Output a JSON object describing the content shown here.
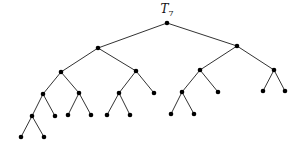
{
  "diagram": {
    "type": "binary-tree",
    "title": "T",
    "title_subscript": "7",
    "title_pos": [
      167,
      13
    ],
    "node_radius": 2.3,
    "colors": {
      "edge": "#333333",
      "node": "#000000",
      "background": "#ffffff"
    },
    "nodes": [
      {
        "id": "r",
        "x": 167,
        "y": 23
      },
      {
        "id": "L",
        "x": 98,
        "y": 48
      },
      {
        "id": "R",
        "x": 237,
        "y": 46
      },
      {
        "id": "LL",
        "x": 61,
        "y": 72
      },
      {
        "id": "LR",
        "x": 136,
        "y": 71
      },
      {
        "id": "RL",
        "x": 200,
        "y": 70
      },
      {
        "id": "RR",
        "x": 274,
        "y": 70
      },
      {
        "id": "LLL",
        "x": 43,
        "y": 94
      },
      {
        "id": "LLR",
        "x": 79,
        "y": 93
      },
      {
        "id": "LRL",
        "x": 119,
        "y": 93
      },
      {
        "id": "LRR",
        "x": 154,
        "y": 93
      },
      {
        "id": "RLL",
        "x": 182,
        "y": 92
      },
      {
        "id": "RLR",
        "x": 218,
        "y": 92
      },
      {
        "id": "RRL",
        "x": 263,
        "y": 91
      },
      {
        "id": "RRR",
        "x": 285,
        "y": 91
      },
      {
        "id": "LLLL",
        "x": 32,
        "y": 116
      },
      {
        "id": "LLLR",
        "x": 55,
        "y": 116
      },
      {
        "id": "LLRL",
        "x": 68,
        "y": 115
      },
      {
        "id": "LLRR",
        "x": 91,
        "y": 115
      },
      {
        "id": "LRLL",
        "x": 107,
        "y": 115
      },
      {
        "id": "LRLR",
        "x": 130,
        "y": 115
      },
      {
        "id": "RLLL",
        "x": 171,
        "y": 114
      },
      {
        "id": "RLLR",
        "x": 194,
        "y": 114
      },
      {
        "id": "LLLLL",
        "x": 21,
        "y": 137
      },
      {
        "id": "LLLLR",
        "x": 44,
        "y": 137
      }
    ],
    "edges": [
      [
        "r",
        "L"
      ],
      [
        "r",
        "R"
      ],
      [
        "L",
        "LL"
      ],
      [
        "L",
        "LR"
      ],
      [
        "R",
        "RL"
      ],
      [
        "R",
        "RR"
      ],
      [
        "LL",
        "LLL"
      ],
      [
        "LL",
        "LLR"
      ],
      [
        "LR",
        "LRL"
      ],
      [
        "LR",
        "LRR"
      ],
      [
        "RL",
        "RLL"
      ],
      [
        "RL",
        "RLR"
      ],
      [
        "RR",
        "RRL"
      ],
      [
        "RR",
        "RRR"
      ],
      [
        "LLL",
        "LLLL"
      ],
      [
        "LLL",
        "LLLR"
      ],
      [
        "LLR",
        "LLRL"
      ],
      [
        "LLR",
        "LLRR"
      ],
      [
        "LRL",
        "LRLL"
      ],
      [
        "LRL",
        "LRLR"
      ],
      [
        "RLL",
        "RLLL"
      ],
      [
        "RLL",
        "RLLR"
      ],
      [
        "LLLL",
        "LLLLL"
      ],
      [
        "LLLL",
        "LLLLR"
      ]
    ]
  }
}
